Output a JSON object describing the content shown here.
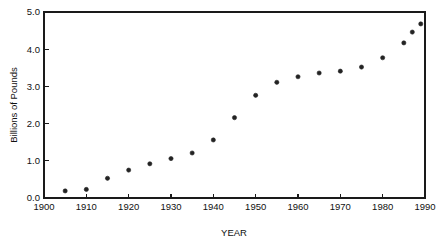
{
  "chart_data": {
    "type": "scatter",
    "title": "",
    "subtitle": "",
    "xlabel": "YEAR",
    "ylabel": "Billions of Pounds",
    "xlim": [
      1900,
      1990
    ],
    "ylim": [
      0.0,
      5.0
    ],
    "grid": false,
    "legend": null,
    "legend_position": "none",
    "x_ticks": [
      1900,
      1910,
      1920,
      1930,
      1940,
      1950,
      1960,
      1970,
      1980,
      1990
    ],
    "x_tick_labels": [
      "1900",
      "1910",
      "1920",
      "1930",
      "1940",
      "1950",
      "1960",
      "1970",
      "1980",
      "1990"
    ],
    "y_ticks": [
      0.0,
      1.0,
      2.0,
      3.0,
      4.0,
      5.0
    ],
    "y_tick_labels": [
      "0.0",
      "1.0",
      "2.0",
      "3.0",
      "4.0",
      "5.0"
    ],
    "marker": "circle",
    "marker_color": "#232323",
    "x": [
      1905,
      1910,
      1915,
      1920,
      1925,
      1930,
      1935,
      1940,
      1945,
      1950,
      1955,
      1960,
      1965,
      1970,
      1975,
      1980,
      1985,
      1987,
      1989
    ],
    "values": [
      0.19,
      0.23,
      0.53,
      0.75,
      0.92,
      1.06,
      1.21,
      1.56,
      2.16,
      2.76,
      3.11,
      3.26,
      3.36,
      3.41,
      3.52,
      3.77,
      4.17,
      4.46,
      4.68
    ],
    "points": [
      {
        "x": 1905,
        "y": 0.19
      },
      {
        "x": 1910,
        "y": 0.23
      },
      {
        "x": 1915,
        "y": 0.53
      },
      {
        "x": 1920,
        "y": 0.75
      },
      {
        "x": 1925,
        "y": 0.92
      },
      {
        "x": 1930,
        "y": 1.06
      },
      {
        "x": 1935,
        "y": 1.21
      },
      {
        "x": 1940,
        "y": 1.56
      },
      {
        "x": 1945,
        "y": 2.16
      },
      {
        "x": 1950,
        "y": 2.76
      },
      {
        "x": 1955,
        "y": 3.11
      },
      {
        "x": 1960,
        "y": 3.26
      },
      {
        "x": 1965,
        "y": 3.36
      },
      {
        "x": 1970,
        "y": 3.41
      },
      {
        "x": 1975,
        "y": 3.52
      },
      {
        "x": 1980,
        "y": 3.77
      },
      {
        "x": 1985,
        "y": 4.17
      },
      {
        "x": 1987,
        "y": 4.46
      },
      {
        "x": 1989,
        "y": 4.68
      }
    ]
  },
  "plot_box": {
    "left": 44,
    "right": 425,
    "top": 12,
    "bottom": 198
  }
}
